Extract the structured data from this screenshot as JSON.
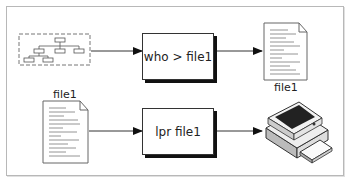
{
  "diagram": {
    "top_row": {
      "source": "directory-tree-icon",
      "command": "who > file1",
      "output_label": "file1"
    },
    "bottom_row": {
      "input_label": "file1",
      "command": "lpr file1",
      "destination": "printer-icon"
    }
  }
}
